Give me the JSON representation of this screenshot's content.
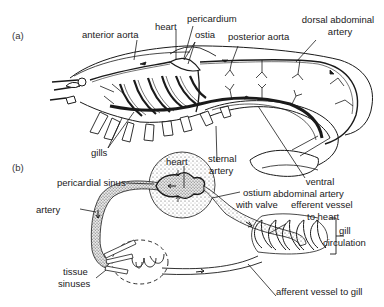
{
  "figure": {
    "panel_a": {
      "tag": "(a)",
      "labels": {
        "anterior_aorta": "anterior aorta",
        "heart": "heart",
        "pericardium": "pericardium",
        "ostia": "ostia",
        "posterior_aorta": "posterior aorta",
        "dorsal_abdominal_artery_1": "dorsal abdominal",
        "dorsal_abdominal_artery_2": "artery",
        "gills": "gills",
        "sternal_artery_1": "sternal",
        "sternal_artery_2": "artery",
        "ventral_abdominal_artery_1": "ventral",
        "ventral_abdominal_artery_2": "abdominal artery"
      }
    },
    "panel_b": {
      "tag": "(b)",
      "labels": {
        "heart": "heart",
        "pericardial_sinus": "pericardial sinus",
        "ostium_with_valve_1": "ostium",
        "ostium_with_valve_2": "with valve",
        "artery": "artery",
        "efferent_vessel_1": "efferent vessel",
        "efferent_vessel_2": "to heart",
        "gill_circulation_1": "gill",
        "gill_circulation_2": "circulation",
        "tissue_sinuses_1": "tissue",
        "tissue_sinuses_2": "sinuses",
        "afferent_vessel": "afferent vessel to gill"
      }
    }
  }
}
